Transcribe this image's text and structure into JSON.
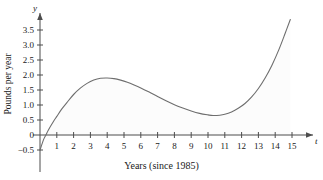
{
  "chart_data": {
    "type": "line",
    "title": "",
    "xlabel": "Years (since 1985)",
    "ylabel": "Pounds per year",
    "x_axis_symbol": "t",
    "y_axis_symbol": "y",
    "xlim": [
      0,
      15.6
    ],
    "ylim": [
      -0.6,
      3.9
    ],
    "grid": false,
    "legend": null,
    "xticks": [
      1,
      2,
      3,
      4,
      5,
      6,
      7,
      8,
      9,
      10,
      11,
      12,
      13,
      14,
      15
    ],
    "xtick_labels": [
      "1",
      "2",
      "3",
      "4",
      "5",
      "6",
      "7",
      "8",
      "9",
      "10",
      "11",
      "12",
      "13",
      "14",
      "15"
    ],
    "yticks": [
      -0.5,
      0,
      0.5,
      1.0,
      1.5,
      2.0,
      2.5,
      3.0,
      3.5
    ],
    "ytick_labels": [
      "−0.5",
      "0",
      "0.5",
      "1.0",
      "1.5",
      "2.0",
      "2.5",
      "3.0",
      "3.5"
    ],
    "curve_color": "#6e6e6e",
    "axis_color": "#4d4d4d",
    "series": [
      {
        "name": "rate of change",
        "x": [
          0.0,
          0.2,
          0.35,
          0.5,
          0.8,
          1.0,
          1.3,
          1.6,
          2.0,
          2.4,
          2.8,
          3.2,
          3.6,
          4.0,
          4.4,
          4.8,
          5.2,
          5.6,
          6.0,
          6.5,
          7.0,
          7.5,
          8.0,
          8.5,
          9.0,
          9.5,
          10.0,
          10.3,
          10.7,
          11.0,
          11.4,
          11.8,
          12.2,
          12.6,
          13.0,
          13.4,
          13.8,
          14.2,
          14.6,
          14.9
        ],
        "y": [
          -0.5,
          -0.17,
          0.0,
          0.17,
          0.45,
          0.62,
          0.87,
          1.08,
          1.35,
          1.56,
          1.72,
          1.83,
          1.89,
          1.9,
          1.88,
          1.83,
          1.76,
          1.67,
          1.57,
          1.43,
          1.28,
          1.14,
          1.01,
          0.9,
          0.8,
          0.72,
          0.67,
          0.65,
          0.66,
          0.69,
          0.77,
          0.89,
          1.05,
          1.27,
          1.55,
          1.9,
          2.32,
          2.82,
          3.4,
          3.85
        ]
      }
    ],
    "annotations": {
      "local_max": {
        "t": 4.0,
        "value": 1.9
      },
      "local_min": {
        "t": 10.3,
        "value": 0.65
      },
      "zero_crossing": {
        "t": 0.35,
        "value": 0
      },
      "start_point": {
        "t": 0.0,
        "value": -0.5
      },
      "end_point": {
        "t": 14.9,
        "value": 3.85
      }
    }
  },
  "axes": {
    "y_symbol": "y",
    "x_symbol": "t",
    "y_title": "Pounds per year",
    "x_title": "Years (since 1985)"
  }
}
